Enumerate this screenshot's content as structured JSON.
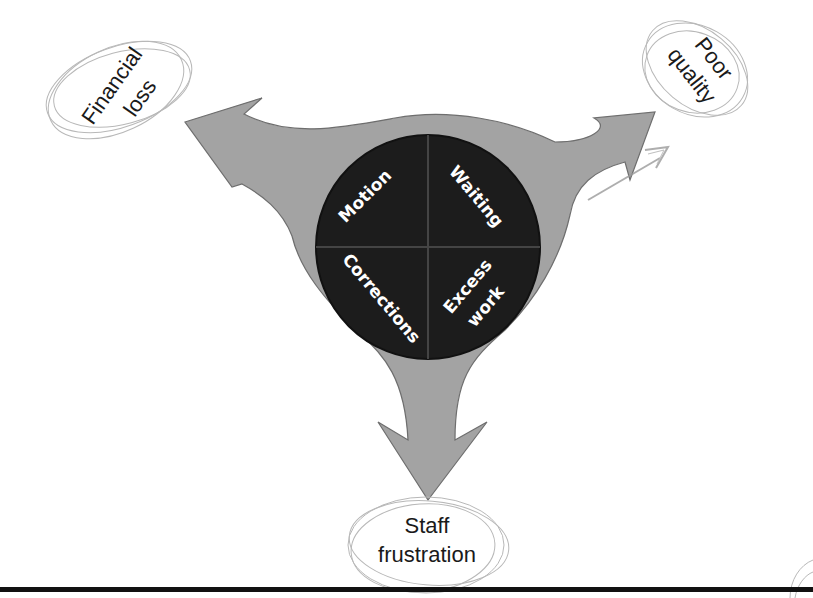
{
  "diagram": {
    "type": "waste-impact diagram",
    "center": {
      "quadrants": [
        {
          "position": "top-left",
          "label": "Motion"
        },
        {
          "position": "top-right",
          "label": "Waiting"
        },
        {
          "position": "bottom-left",
          "label": "Corrections"
        },
        {
          "position": "bottom-right",
          "label": "Excess work"
        }
      ],
      "labels": {
        "motion": "Motion",
        "waiting": "Waiting",
        "corrections": "Corrections",
        "excess_line1": "Excess",
        "excess_line2": "work"
      }
    },
    "outcomes": {
      "financial_loss": {
        "line1": "Financial",
        "line2": "loss",
        "direction": "up-left"
      },
      "poor_quality": {
        "line1": "Poor",
        "line2": "quality",
        "direction": "up-right"
      },
      "staff_frustration": {
        "line1": "Staff",
        "line2": "frustration",
        "direction": "down"
      }
    },
    "colors": {
      "arrow_fill": "#a3a3a3",
      "arrow_stroke": "#6e6e6e",
      "circle_fill": "#1c1c1c",
      "quad_text": "#ffffff",
      "sketch_stroke": "#b8b8b8",
      "rule": "#111111"
    }
  }
}
